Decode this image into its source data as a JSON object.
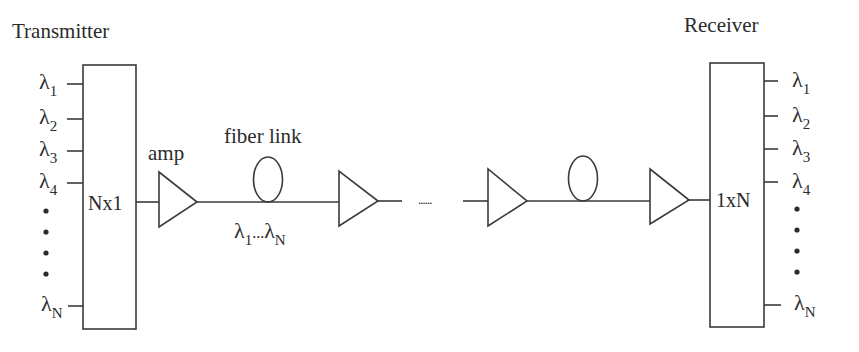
{
  "diagram": {
    "transmitter": {
      "title": "Transmitter",
      "mux_label": "Nx1",
      "inputs": [
        {
          "symbol": "λ",
          "sub": "1"
        },
        {
          "symbol": "λ",
          "sub": "2"
        },
        {
          "symbol": "λ",
          "sub": "3"
        },
        {
          "symbol": "λ",
          "sub": "4"
        },
        {
          "symbol": "λ",
          "sub": "N"
        }
      ],
      "ellipsis_dots": 4
    },
    "link": {
      "amp_label": "amp",
      "fiber_label": "fiber link",
      "channel_label": {
        "start": "λ",
        "start_sub": "1",
        "mid": "...",
        "end": "λ",
        "end_sub": "N"
      },
      "continuation": "......"
    },
    "receiver": {
      "title": "Receiver",
      "demux_label": "1xN",
      "outputs": [
        {
          "symbol": "λ",
          "sub": "1"
        },
        {
          "symbol": "λ",
          "sub": "2"
        },
        {
          "symbol": "λ",
          "sub": "3"
        },
        {
          "symbol": "λ",
          "sub": "4"
        },
        {
          "symbol": "λ",
          "sub": "N"
        }
      ],
      "ellipsis_dots": 4
    }
  }
}
